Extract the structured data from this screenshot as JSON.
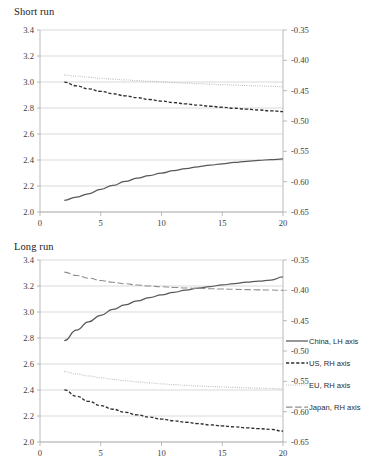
{
  "figure": {
    "width": 369,
    "height": 473,
    "background": "#ffffff"
  },
  "legend": {
    "position": "right-middle",
    "items": [
      {
        "label": "China, LH axis",
        "key": "china",
        "style": "solid",
        "color": "#585858"
      },
      {
        "label": "US, RH axis",
        "key": "us",
        "style": "dashed",
        "color": "#2e2e2e"
      },
      {
        "label": "EU, RH axis",
        "key": "eu",
        "style": "dotted",
        "color": "#b9b9b9"
      },
      {
        "label": "Japan, RH axis",
        "key": "japan",
        "style": "long-dash",
        "color": "#8e8e8e"
      }
    ]
  },
  "chart_data": [
    {
      "type": "line",
      "title": "Short run",
      "xlabel": "",
      "ylabel": "",
      "grid": true,
      "legend": "right",
      "xlim": [
        0,
        20
      ],
      "xticks": [
        0,
        5,
        10,
        15,
        20
      ],
      "ylim_left": [
        2.0,
        3.4
      ],
      "yticks_left": [
        "2.0",
        "2.2",
        "2.4",
        "2.6",
        "2.8",
        "3.0",
        "3.2",
        "3.4"
      ],
      "ylim_right": [
        -0.65,
        -0.35
      ],
      "yticks_right": [
        "-0.65",
        "-0.60",
        "-0.55",
        "-0.50",
        "-0.45",
        "-0.40",
        "-0.35"
      ],
      "x": [
        2,
        3,
        4,
        5,
        6,
        7,
        8,
        9,
        10,
        11,
        12,
        13,
        14,
        15,
        16,
        17,
        18,
        19,
        20
      ],
      "series": [
        {
          "name": "China, LH axis",
          "key": "china",
          "axis": "left",
          "style": "solid",
          "values": [
            2.09,
            2.115,
            2.14,
            2.175,
            2.205,
            2.235,
            2.26,
            2.28,
            2.3,
            2.318,
            2.334,
            2.348,
            2.36,
            2.371,
            2.381,
            2.39,
            2.397,
            2.403,
            2.408
          ]
        },
        {
          "name": "US, RH axis",
          "key": "us",
          "axis": "right",
          "style": "dashed",
          "values": [
            -0.436,
            -0.442,
            -0.447,
            -0.4512,
            -0.455,
            -0.4585,
            -0.4616,
            -0.4645,
            -0.4672,
            -0.4696,
            -0.4718,
            -0.4738,
            -0.4757,
            -0.4774,
            -0.479,
            -0.4805,
            -0.4819,
            -0.4832,
            -0.4845
          ]
        },
        {
          "name": "EU, RH axis",
          "key": "eu",
          "axis": "right",
          "style": "dotted",
          "values": [
            -0.4243,
            -0.4262,
            -0.428,
            -0.4296,
            -0.431,
            -0.4323,
            -0.4335,
            -0.4346,
            -0.4357,
            -0.4367,
            -0.4376,
            -0.4385,
            -0.4393,
            -0.4401,
            -0.4408,
            -0.4415,
            -0.4422,
            -0.4428,
            -0.4434
          ]
        },
        {
          "name": "Japan, RH axis",
          "key": "japan",
          "axis": "right",
          "style": "long-dash",
          "values": [
            null,
            null,
            null,
            null,
            null,
            null,
            null,
            null,
            null,
            null,
            null,
            null,
            null,
            null,
            null,
            null,
            null,
            null,
            null
          ]
        }
      ]
    },
    {
      "type": "line",
      "title": "Long run",
      "xlabel": "",
      "ylabel": "",
      "grid": true,
      "legend": "right",
      "xlim": [
        0,
        20
      ],
      "xticks": [
        0,
        5,
        10,
        15,
        20
      ],
      "ylim_left": [
        2.0,
        3.4
      ],
      "yticks_left": [
        "2.0",
        "2.2",
        "2.4",
        "2.6",
        "2.8",
        "3.0",
        "3.2",
        "3.4"
      ],
      "ylim_right": [
        -0.65,
        -0.35
      ],
      "yticks_right": [
        "-0.65",
        "-0.60",
        "-0.55",
        "-0.50",
        "-0.45",
        "-0.40",
        "-0.35"
      ],
      "x": [
        2,
        3,
        4,
        5,
        6,
        7,
        8,
        9,
        10,
        11,
        12,
        13,
        14,
        15,
        16,
        17,
        18,
        19,
        20
      ],
      "series": [
        {
          "name": "China, LH axis",
          "key": "china",
          "axis": "left",
          "style": "solid",
          "values": [
            2.78,
            2.86,
            2.925,
            2.975,
            3.02,
            3.055,
            3.085,
            3.11,
            3.132,
            3.151,
            3.168,
            3.183,
            3.196,
            3.208,
            3.219,
            3.229,
            3.238,
            3.246,
            3.27
          ]
        },
        {
          "name": "US, RH axis",
          "key": "us",
          "axis": "right",
          "style": "dashed",
          "values": [
            -0.564,
            -0.5745,
            -0.583,
            -0.59,
            -0.596,
            -0.601,
            -0.6053,
            -0.609,
            -0.6122,
            -0.615,
            -0.6175,
            -0.6197,
            -0.6217,
            -0.6235,
            -0.6251,
            -0.6266,
            -0.628,
            -0.6292,
            -0.632
          ]
        },
        {
          "name": "EU, RH axis",
          "key": "eu",
          "axis": "right",
          "style": "dotted",
          "values": [
            -0.534,
            -0.5378,
            -0.5412,
            -0.5442,
            -0.5468,
            -0.549,
            -0.5509,
            -0.5526,
            -0.5541,
            -0.5554,
            -0.5566,
            -0.5576,
            -0.5585,
            -0.5593,
            -0.56,
            -0.5607,
            -0.5613,
            -0.5618,
            -0.5625
          ]
        },
        {
          "name": "Japan, RH axis",
          "key": "japan",
          "axis": "right",
          "style": "long-dash",
          "values": [
            -0.37,
            -0.3755,
            -0.38,
            -0.3838,
            -0.3868,
            -0.3892,
            -0.3912,
            -0.3928,
            -0.3941,
            -0.3952,
            -0.3961,
            -0.3968,
            -0.3974,
            -0.3979,
            -0.3984,
            -0.3988,
            -0.3992,
            -0.3995,
            -0.4
          ]
        }
      ]
    }
  ]
}
